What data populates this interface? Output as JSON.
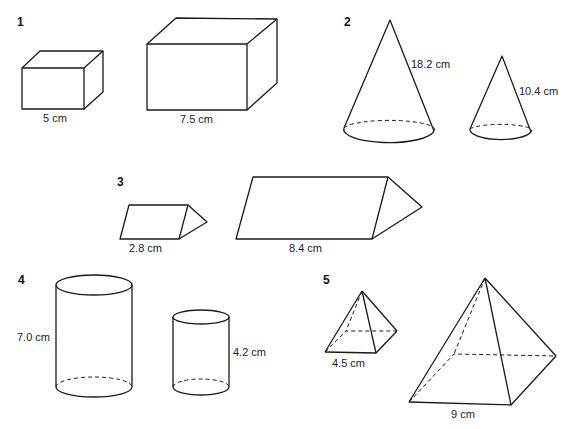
{
  "problems": [
    {
      "number": "1",
      "shape": "cuboid",
      "labels": [
        "5 cm",
        "7.5 cm"
      ]
    },
    {
      "number": "2",
      "shape": "cone",
      "labels": [
        "18.2 cm",
        "10.4 cm"
      ]
    },
    {
      "number": "3",
      "shape": "triangular prism",
      "labels": [
        "2.8 cm",
        "8.4 cm"
      ]
    },
    {
      "number": "4",
      "shape": "cylinder",
      "labels": [
        "7.0 cm",
        "4.2 cm"
      ]
    },
    {
      "number": "5",
      "shape": "square pyramid",
      "labels": [
        "4.5 cm",
        "9 cm"
      ]
    }
  ]
}
